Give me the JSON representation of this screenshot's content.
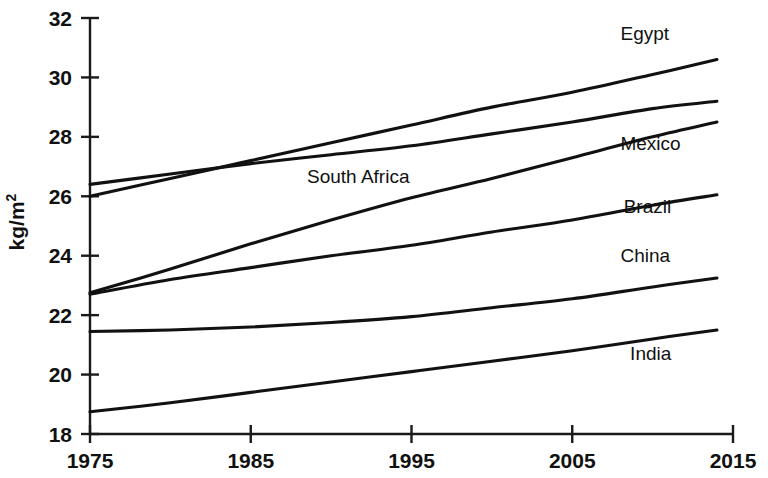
{
  "chart_data": {
    "type": "line",
    "title": "",
    "xlabel": "",
    "ylabel": "kg/m2",
    "ylabel_display": "kg/m",
    "ylabel_exponent": "2",
    "xlim": [
      1975,
      2015
    ],
    "ylim": [
      18,
      32
    ],
    "grid": false,
    "legend_position": "inline-right",
    "xticks": [
      "1975",
      "1985",
      "1995",
      "2005",
      "2015"
    ],
    "xtick_values": [
      1975,
      1985,
      1995,
      2005,
      2015
    ],
    "yticks": [
      "18",
      "20",
      "22",
      "24",
      "26",
      "28",
      "30",
      "32"
    ],
    "ytick_values": [
      18,
      20,
      22,
      24,
      26,
      28,
      30,
      32
    ],
    "x": [
      1975,
      1980,
      1985,
      1990,
      1995,
      2000,
      2005,
      2010,
      2014
    ],
    "series": [
      {
        "name": "Egypt",
        "label": "Egypt",
        "label_x": 2008.0,
        "label_y": 31.25,
        "values": [
          26.0,
          26.6,
          27.2,
          27.8,
          28.4,
          29.0,
          29.5,
          30.1,
          30.6
        ]
      },
      {
        "name": "South Africa",
        "label": "South Africa",
        "label_x": 1988.5,
        "label_y": 26.45,
        "values": [
          26.4,
          26.75,
          27.1,
          27.4,
          27.7,
          28.1,
          28.5,
          28.95,
          29.2
        ]
      },
      {
        "name": "Mexico",
        "label": "Mexico",
        "label_x": 2008.0,
        "label_y": 27.55,
        "values": [
          22.75,
          23.55,
          24.4,
          25.2,
          25.95,
          26.6,
          27.3,
          28.0,
          28.5
        ]
      },
      {
        "name": "Brazil",
        "label": "Brazil",
        "label_x": 2008.2,
        "label_y": 25.45,
        "values": [
          22.7,
          23.2,
          23.6,
          24.0,
          24.35,
          24.8,
          25.2,
          25.7,
          26.05
        ]
      },
      {
        "name": "China",
        "label": "China",
        "label_x": 2008.0,
        "label_y": 23.8,
        "values": [
          21.45,
          21.5,
          21.6,
          21.75,
          21.95,
          22.25,
          22.55,
          22.95,
          23.25
        ]
      },
      {
        "name": "India",
        "label": "India",
        "label_x": 2008.6,
        "label_y": 20.5,
        "values": [
          18.75,
          19.05,
          19.4,
          19.75,
          20.1,
          20.45,
          20.8,
          21.2,
          21.5
        ]
      }
    ]
  },
  "axes": {
    "y_axis_name": "y-axis",
    "x_axis_name": "x-axis"
  }
}
